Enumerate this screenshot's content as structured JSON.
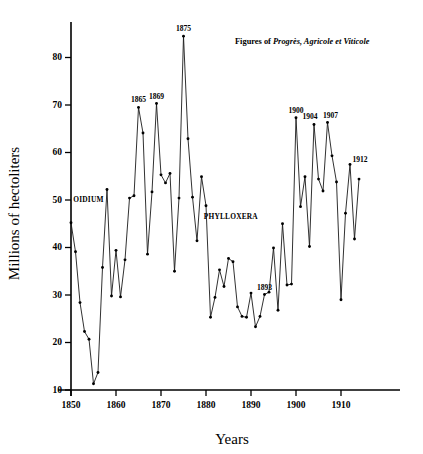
{
  "chart_data": {
    "type": "line",
    "title": "",
    "xlabel": "Years",
    "ylabel": "Millions of hectoliters",
    "xlim": [
      1848,
      1915
    ],
    "ylim": [
      10,
      87
    ],
    "grid": false,
    "legend": "none",
    "xticks": [
      1850,
      1860,
      1870,
      1880,
      1890,
      1900,
      1910
    ],
    "yticks": [
      10,
      20,
      30,
      40,
      50,
      60,
      70,
      80
    ],
    "series": [
      {
        "name": "French wine production",
        "x": [
          1850,
          1851,
          1852,
          1853,
          1854,
          1855,
          1856,
          1857,
          1858,
          1859,
          1860,
          1861,
          1862,
          1863,
          1864,
          1865,
          1866,
          1867,
          1868,
          1869,
          1870,
          1871,
          1872,
          1873,
          1874,
          1875,
          1876,
          1877,
          1878,
          1879,
          1880,
          1881,
          1882,
          1883,
          1884,
          1885,
          1886,
          1887,
          1888,
          1889,
          1890,
          1891,
          1892,
          1893,
          1894,
          1895,
          1896,
          1897,
          1898,
          1899,
          1900,
          1901,
          1902,
          1903,
          1904,
          1905,
          1906,
          1907,
          1908,
          1909,
          1910,
          1911,
          1912,
          1913,
          1914
        ],
        "values": [
          45.2,
          39.1,
          28.4,
          22.3,
          20.7,
          11.3,
          13.7,
          35.8,
          52.2,
          29.8,
          39.4,
          29.6,
          37.4,
          50.4,
          50.9,
          69.5,
          64.1,
          38.6,
          51.7,
          70.3,
          55.3,
          53.6,
          55.6,
          35.0,
          50.4,
          84.5,
          62.9,
          50.6,
          41.4,
          54.9,
          48.8,
          25.3,
          29.5,
          35.3,
          31.8,
          37.7,
          37.0,
          27.5,
          25.5,
          25.3,
          30.4,
          23.3,
          25.5,
          30.1,
          30.6,
          39.9,
          26.8,
          45.0,
          32.1,
          32.3,
          67.3,
          48.6,
          54.9,
          40.2,
          65.9,
          54.4,
          51.9,
          66.3,
          59.3,
          53.8,
          29.0,
          47.2,
          57.5,
          41.8,
          54.4
        ]
      }
    ],
    "point_labels": [
      {
        "year": 1865,
        "label": "1865"
      },
      {
        "year": 1869,
        "label": "1869"
      },
      {
        "year": 1875,
        "label": "1875"
      },
      {
        "year": 1893,
        "label": "1893"
      },
      {
        "year": 1900,
        "label": "1900"
      },
      {
        "year": 1904,
        "label": "1904"
      },
      {
        "year": 1907,
        "label": "1907"
      },
      {
        "year": 1912,
        "label": "1912"
      }
    ],
    "event_annotations": [
      {
        "label": "OIDIUM",
        "year": 1850.5,
        "value": 49.5
      },
      {
        "label": "PHYLLOXERA",
        "year": 1879.5,
        "value": 46.0
      }
    ],
    "source_note": {
      "prefix": "Figures of ",
      "italic": "Progrès, Agricole et Viticole"
    }
  }
}
